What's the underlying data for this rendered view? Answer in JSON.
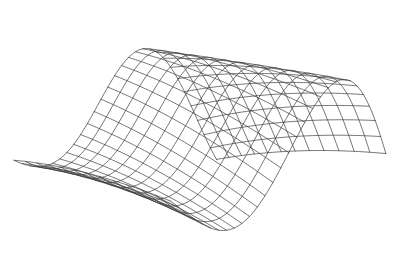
{
  "figure": {
    "title": "",
    "kind": "3d-wireframe-surface-plot",
    "background_color": "#ffffff",
    "line_color": "#3a3a3a",
    "line_width": 0.7,
    "width": 396,
    "height": 267,
    "axes_visible": false,
    "labels_visible": false,
    "ticks_visible": false
  },
  "chart_data": {
    "type": "line",
    "title": "",
    "subtitle": "",
    "xlabel": "",
    "ylabel": "",
    "zlabel": "",
    "render_style": "wireframe",
    "surface_equation": "z = A * exp(-((u-u0)/su)^2) * sin(k*u + p) - B*v^2*tilt",
    "grid": true,
    "legend": null,
    "annotations": [],
    "u_samples": 30,
    "v_samples": 13,
    "u_range": [
      -1.0,
      1.0
    ],
    "v_range": [
      -1.0,
      1.0
    ],
    "xlim": [
      -1.0,
      1.0
    ],
    "ylim": [
      -1.0,
      1.0
    ],
    "zlim": [
      -1.0,
      1.0
    ],
    "projection": {
      "type": "oblique-perspective",
      "azimuth_deg": -38,
      "elevation_deg": 22,
      "distance": 6.0,
      "scale_x": 182,
      "scale_y": 120,
      "origin_x": 196,
      "origin_y": 140
    },
    "surface_params": {
      "crest_amplitude": 1.0,
      "trough_amplitude": -0.82,
      "wave_number": 3.05,
      "phase": 0.55,
      "twist": 0.42,
      "depth_taper": 0.3
    },
    "series": [
      {
        "name": "u-isolines",
        "count": 30,
        "values": []
      },
      {
        "name": "v-isolines",
        "count": 13,
        "values": []
      }
    ]
  }
}
